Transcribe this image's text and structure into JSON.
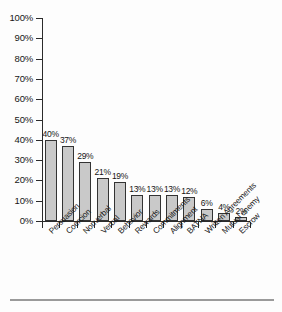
{
  "chart_data": {
    "type": "bar",
    "title": "",
    "subtitle": "",
    "xlabel": "",
    "ylabel": "",
    "ylim": [
      0,
      100
    ],
    "grid": false,
    "legend": null,
    "orientation": "vertical",
    "unit": "%",
    "categories": [
      "Persuasion",
      "Coercion",
      "Nonverbal",
      "Verbal",
      "Behavior",
      "Rewards",
      "Commitments",
      "Alignment",
      "BATNA",
      "Written Agreements",
      "Mutual enemy",
      "Escrow"
    ],
    "values": [
      40,
      37,
      29,
      21,
      19,
      13,
      13,
      13,
      12,
      6,
      4,
      2
    ],
    "data_labels": [
      "40%",
      "37%",
      "29%",
      "21%",
      "19%",
      "13%",
      "13%",
      "13%",
      "12%",
      "6%",
      "4%",
      "2%"
    ],
    "ytick_labels": [
      "100%",
      "90%",
      "80%",
      "70%",
      "60%",
      "50%",
      "40%",
      "30%",
      "20%",
      "10%",
      "0%"
    ],
    "ytick_values": [
      100,
      90,
      80,
      70,
      60,
      50,
      40,
      30,
      20,
      10,
      0
    ],
    "bar_fill_color": "#c9c9c9",
    "bar_edge_color": "#333333",
    "axis_color": "#2b2b2b",
    "text_color": "#171717",
    "background_color": "#fdfdfd"
  }
}
